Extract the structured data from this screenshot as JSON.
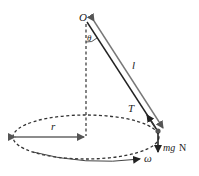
{
  "diagram": {
    "labels": {
      "pivot": "O",
      "angle": "θ",
      "length": "l",
      "tension": "T",
      "radius": "r",
      "angular_velocity": "ω",
      "weight": "mg",
      "weight_unit": "N"
    },
    "colors": {
      "line": "#222222",
      "arrow_gray": "#666666",
      "dash": "#333333"
    }
  }
}
